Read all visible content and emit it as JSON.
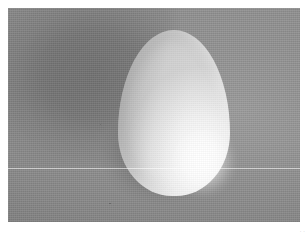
{
  "image": {
    "kind": "photograph",
    "subject": "egg",
    "description": "Grayscale photograph of a single white chicken egg resting on a gray woven cloth surface, lit from the lower right",
    "orientation": "landscape",
    "color_mode": "grayscale",
    "frame": {
      "page_width": 307,
      "page_height": 236,
      "margin_color": "#ffffff",
      "plate_left": 8,
      "plate_top": 8,
      "plate_width": 292,
      "plate_height": 214
    },
    "background": {
      "name": "gray woven cloth",
      "base_color": "#8a8a8a",
      "texture": "fine horizontal and vertical weave lines",
      "shadow_color": "#6e6e6e",
      "shadow_position": "left and upper-left of the egg"
    },
    "subject_geometry": {
      "shape": "ovoid",
      "apex": "top",
      "left_edge_pct": 37.7,
      "top_edge_pct": 10.3,
      "width_pct": 38.4,
      "height_pct": 77.5,
      "highlight_position": "lower right",
      "highlight_color": "#ffffff",
      "shade_position": "left flank",
      "shade_color": "#c9c9c9"
    },
    "artifacts": {
      "scanline_label": "horizontal scanline",
      "scanline_top_pct": 74.8,
      "scanline_color": "#ffffff",
      "speck_label": "dust speck"
    }
  },
  "watermark": {
    "text": "· ·",
    "color": "#b6b6b6"
  }
}
